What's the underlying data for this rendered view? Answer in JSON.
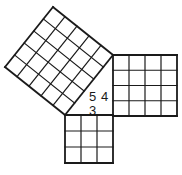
{
  "diagram": {
    "type": "pythagorean-theorem-3-4-5",
    "stroke_color": "#1a1a1a",
    "background": "#ffffff",
    "triangle": {
      "legs": [
        3,
        4
      ],
      "hypotenuse": 5
    },
    "squares": [
      {
        "name": "hypotenuse-square",
        "grid": 5
      },
      {
        "name": "leg-4-square",
        "grid": 4
      },
      {
        "name": "leg-3-square",
        "grid": 3
      }
    ],
    "labels": {
      "hypotenuse": "5",
      "leg_vertical": "4",
      "leg_horizontal": "3"
    }
  }
}
